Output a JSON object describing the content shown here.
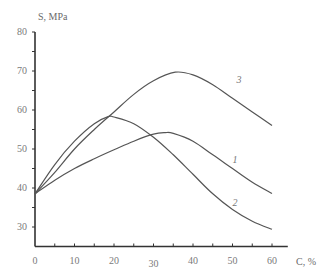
{
  "chart_data": {
    "type": "line",
    "title": "",
    "xlabel": "C, %",
    "ylabel": "S, MPa",
    "xlim": [
      0,
      64
    ],
    "ylim": [
      25,
      80
    ],
    "x_ticks": [
      0,
      10,
      20,
      30,
      40,
      50,
      60
    ],
    "x_tick_labels": [
      "0",
      "10",
      "20",
      "30",
      "40",
      "50",
      "60"
    ],
    "y_ticks": [
      30,
      40,
      50,
      60,
      70,
      80
    ],
    "y_tick_labels": [
      "30",
      "40",
      "50",
      "60",
      "70",
      "80"
    ],
    "grid": false,
    "legend": "inline curve labels",
    "series": [
      {
        "name": "1",
        "x": [
          0,
          5,
          10,
          15,
          20,
          25,
          30,
          33,
          35,
          40,
          45,
          50,
          55,
          60
        ],
        "y": [
          38.5,
          42,
          45,
          47.5,
          49.8,
          52,
          53.8,
          54.2,
          54,
          52,
          48.5,
          45,
          41.5,
          38.6
        ]
      },
      {
        "name": "2",
        "x": [
          0,
          5,
          10,
          15,
          18.5,
          20,
          25,
          30,
          35,
          40,
          45,
          50,
          55,
          60
        ],
        "y": [
          38.5,
          46,
          52,
          56.5,
          58.3,
          58.2,
          56.5,
          53,
          48.5,
          43.5,
          38.5,
          34.5,
          31.5,
          29.4
        ]
      },
      {
        "name": "3",
        "x": [
          0,
          5,
          10,
          15,
          20,
          25,
          30,
          35.5,
          40,
          45,
          50,
          55,
          60
        ],
        "y": [
          38.5,
          44,
          50,
          55,
          59.5,
          64,
          67.5,
          69.7,
          69,
          66.5,
          63,
          59.5,
          56
        ]
      }
    ],
    "annotations": [
      {
        "text": "1",
        "x": 50,
        "y": 46.5
      },
      {
        "text": "2",
        "x": 50,
        "y": 35.5
      },
      {
        "text": "3",
        "x": 51,
        "y": 67
      }
    ]
  },
  "labels": {
    "y_axis_title": "S, MPa",
    "x_axis_title": "C, %"
  }
}
